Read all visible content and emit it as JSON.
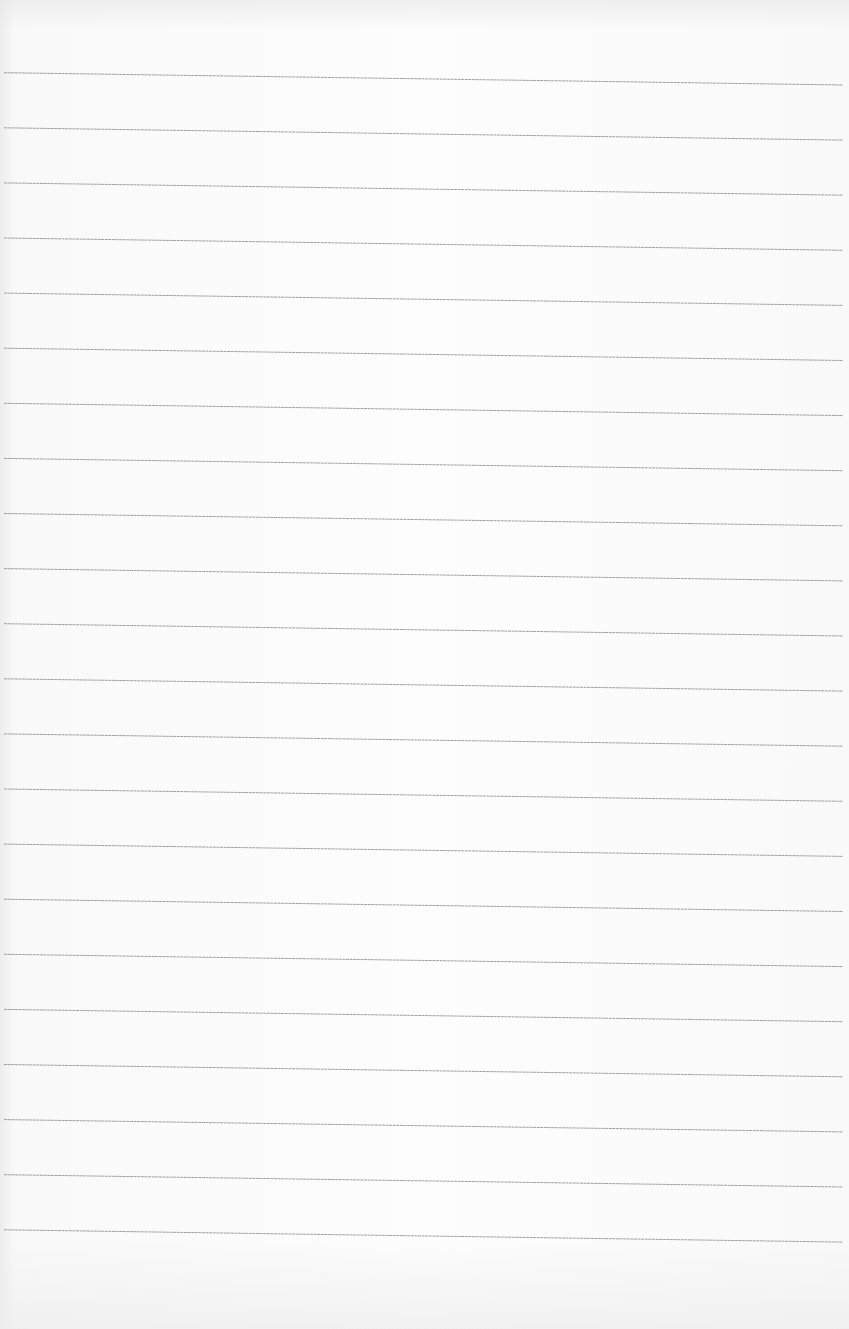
{
  "document": {
    "type": "ruled-paper",
    "text": "",
    "line_count": 22,
    "first_line_left_y": 72.7,
    "first_line_right_y": 85,
    "line_spacing": 55.1,
    "line_start_x": 4,
    "line_end_x": 843,
    "line_color": "#8e8e8e",
    "paper_color": "#fbfbfb"
  }
}
